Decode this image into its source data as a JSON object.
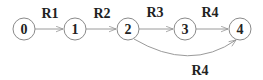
{
  "diagram": {
    "type": "state-chain",
    "nodes": [
      {
        "id": "0",
        "label": "0",
        "cx": 24,
        "cy": 29
      },
      {
        "id": "1",
        "label": "1",
        "cx": 75,
        "cy": 29
      },
      {
        "id": "2",
        "label": "2",
        "cx": 128,
        "cy": 29
      },
      {
        "id": "3",
        "label": "3",
        "cx": 185,
        "cy": 29
      },
      {
        "id": "4",
        "label": "4",
        "cx": 240,
        "cy": 29
      }
    ],
    "edges": [
      {
        "from": "0",
        "to": "1",
        "label": "R1"
      },
      {
        "from": "1",
        "to": "2",
        "label": "R2"
      },
      {
        "from": "2",
        "to": "3",
        "label": "R3"
      },
      {
        "from": "3",
        "to": "4",
        "label": "R4"
      },
      {
        "from": "2",
        "to": "4",
        "label": "R4",
        "curved": true
      }
    ],
    "colors": {
      "stroke": "#8a8a8a",
      "text": "#222222",
      "background": "#ffffff"
    }
  }
}
